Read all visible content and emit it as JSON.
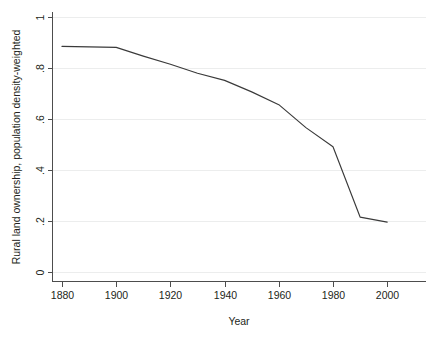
{
  "chart_data": {
    "type": "line",
    "title": "",
    "subtitle": "",
    "xlabel": "Year",
    "ylabel": "Rural land ownership, population density-weighted",
    "xlim": [
      1875,
      2013
    ],
    "ylim": [
      0,
      1
    ],
    "grid": "horizontal",
    "legend": "none",
    "x_ticks": [
      "1880",
      "1900",
      "1920",
      "1940",
      "1960",
      "1980",
      "2000"
    ],
    "x_tick_values": [
      1880,
      1900,
      1920,
      1940,
      1960,
      1980,
      2000
    ],
    "y_ticks": [
      "0",
      ".2",
      ".4",
      ".6",
      ".8",
      "1"
    ],
    "y_tick_values": [
      0,
      0.2,
      0.4,
      0.6,
      0.8,
      1
    ],
    "series": [
      {
        "name": "Rural land ownership, population density-weighted",
        "color": "#3a3a3a",
        "x": [
          1880,
          1900,
          1910,
          1920,
          1930,
          1940,
          1950,
          1960,
          1970,
          1980,
          1990,
          2000
        ],
        "values": [
          0.883,
          0.879,
          0.845,
          0.813,
          0.778,
          0.75,
          0.705,
          0.655,
          0.565,
          0.49,
          0.215,
          0.195
        ]
      }
    ]
  },
  "axes": {
    "x_axis_title": "Year",
    "y_axis_title": "Rural land ownership, population density-weighted"
  }
}
